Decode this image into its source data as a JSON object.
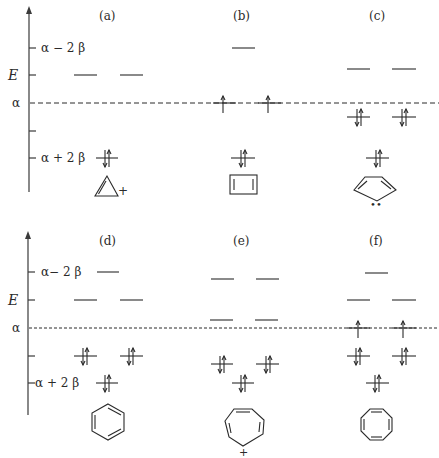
{
  "panels": [
    {
      "id": "a",
      "label": "(a)",
      "molecule": "cyclopropenyl cation",
      "charge": "+",
      "levels": [
        {
          "energy": "alpha+2beta",
          "electrons": 2
        },
        {
          "energy": "alpha-beta",
          "electrons": 0,
          "degenerate": 2
        }
      ]
    },
    {
      "id": "b",
      "label": "(b)",
      "molecule": "cyclobutadiene",
      "levels": [
        {
          "energy": "alpha+2beta",
          "electrons": 2
        },
        {
          "energy": "alpha",
          "electrons": 1,
          "degenerate": 2
        },
        {
          "energy": "alpha-2beta",
          "electrons": 0
        }
      ]
    },
    {
      "id": "c",
      "label": "(c)",
      "molecule": "cyclopentadienyl anion",
      "charge": "••",
      "levels": [
        {
          "energy": "alpha+2beta",
          "electrons": 2
        },
        {
          "energy": "alpha+0.618beta",
          "electrons": 2,
          "degenerate": 2
        },
        {
          "energy": "alpha-1.618beta",
          "electrons": 0,
          "degenerate": 2
        }
      ]
    },
    {
      "id": "d",
      "label": "(d)",
      "molecule": "benzene",
      "levels": [
        {
          "energy": "alpha+2beta",
          "electrons": 2
        },
        {
          "energy": "alpha+beta",
          "electrons": 2,
          "degenerate": 2
        },
        {
          "energy": "alpha-beta",
          "electrons": 0,
          "degenerate": 2
        },
        {
          "energy": "alpha-2beta",
          "electrons": 0
        }
      ]
    },
    {
      "id": "e",
      "label": "(e)",
      "molecule": "tropylium cation",
      "charge": "+",
      "levels": [
        {
          "energy": "alpha+2beta",
          "electrons": 2
        },
        {
          "energy": "alpha+1.247beta",
          "electrons": 2,
          "degenerate": 2
        },
        {
          "energy": "alpha-0.445beta",
          "electrons": 0,
          "degenerate": 2
        },
        {
          "energy": "alpha-1.802beta",
          "electrons": 0,
          "degenerate": 2
        }
      ]
    },
    {
      "id": "f",
      "label": "(f)",
      "molecule": "cyclooctatetraene",
      "levels": [
        {
          "energy": "alpha+2beta",
          "electrons": 2
        },
        {
          "energy": "alpha+1.414beta",
          "electrons": 2,
          "degenerate": 2
        },
        {
          "energy": "alpha",
          "electrons": 1,
          "degenerate": 2
        },
        {
          "energy": "alpha-1.414beta",
          "electrons": 0,
          "degenerate": 2
        },
        {
          "energy": "alpha-2beta",
          "electrons": 0
        }
      ]
    }
  ],
  "axis": {
    "energy_label": "E",
    "alpha_label": "α",
    "top_label": "α − 2 β",
    "bottom_label": "α + 2 β",
    "top_label_bottom_panel": "α− 2 β",
    "bottom_label_bottom_panel": "α + 2 β"
  },
  "labels": {
    "a": "(a)",
    "b": "(b)",
    "c": "(c)",
    "d": "(d)",
    "e": "(e)",
    "f": "(f)",
    "plus": "+",
    "dots": "••"
  }
}
